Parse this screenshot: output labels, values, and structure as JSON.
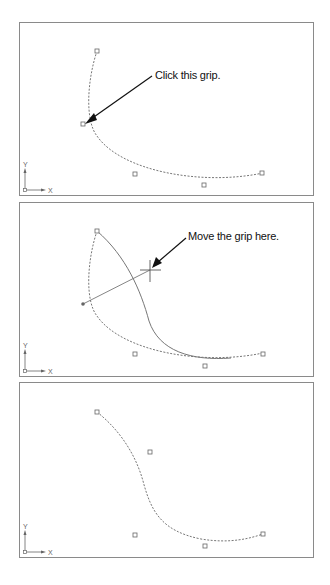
{
  "figure": {
    "panels": [
      {
        "id": "step-1",
        "callout": "Click this grip.",
        "ucs": {
          "x_label": "X",
          "y_label": "Y"
        }
      },
      {
        "id": "step-2",
        "callout": "Move the grip here.",
        "ucs": {
          "x_label": "X",
          "y_label": "Y"
        }
      },
      {
        "id": "step-3",
        "ucs": {
          "x_label": "X",
          "y_label": "Y"
        }
      }
    ],
    "colors": {
      "border": "#8a8a8a",
      "curve": "#777777",
      "grip": "#666666",
      "arrow": "#111111",
      "text": "#111111"
    }
  }
}
